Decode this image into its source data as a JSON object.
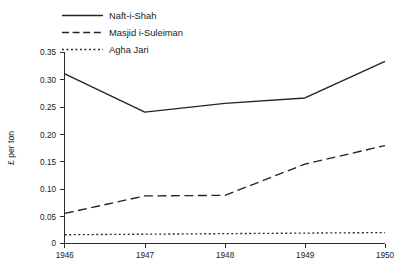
{
  "chart_data": {
    "type": "line",
    "title": "",
    "subtitle": "",
    "xlabel": "",
    "ylabel": "£ per ton",
    "x": [
      1946,
      1947,
      1948,
      1949,
      1950
    ],
    "xtick_labels": [
      "1946",
      "1947",
      "1948",
      "1949",
      "1950"
    ],
    "xlim": [
      1946,
      1950
    ],
    "ylim": [
      0,
      0.35
    ],
    "ytick_labels": [
      "0",
      "0.05",
      "0.10",
      "0.15",
      "0.20",
      "0.25",
      "0.30",
      "0.35"
    ],
    "ytick_values": [
      0,
      0.05,
      0.1,
      0.15,
      0.2,
      0.25,
      0.3,
      0.35
    ],
    "grid": false,
    "legend_position": "top-left-outside",
    "series": [
      {
        "name": "Naft-i-Shah",
        "style": "solid",
        "color": "#242424",
        "values": [
          0.31,
          0.24,
          0.256,
          0.266,
          0.333
        ]
      },
      {
        "name": "Masjid i-Suleiman",
        "style": "dashed",
        "color": "#242424",
        "values": [
          0.055,
          0.087,
          0.088,
          0.145,
          0.179
        ]
      },
      {
        "name": "Agha Jari",
        "style": "dotted",
        "color": "#242424",
        "values": [
          0.016,
          0.017,
          0.018,
          0.019,
          0.02
        ]
      }
    ]
  },
  "legend": {
    "items": [
      {
        "label": "Naft-i-Shah"
      },
      {
        "label": "Masjid i-Suleiman"
      },
      {
        "label": "Agha Jari"
      }
    ]
  },
  "axes": {
    "y_title": "£ per ton",
    "y_ticks": [
      "0.35",
      "0.30",
      "0.25",
      "0.20",
      "0.15",
      "0.10",
      "0.05",
      "0"
    ],
    "x_ticks": [
      "1946",
      "1947",
      "1948",
      "1949",
      "1950"
    ]
  }
}
